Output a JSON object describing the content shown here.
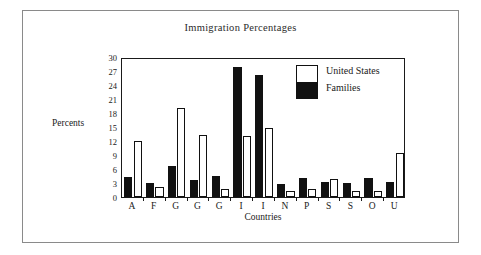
{
  "chart_data": {
    "type": "bar",
    "title": "Immigration Percentages",
    "xlabel": "Countries",
    "ylabel": "Percents",
    "categories": [
      "A",
      "F",
      "G",
      "G",
      "G",
      "I",
      "I",
      "N",
      "P",
      "S",
      "S",
      "O",
      "U"
    ],
    "series": [
      {
        "name": "Families",
        "color": "#111111",
        "values": [
          4.3,
          3.0,
          6.7,
          3.7,
          4.5,
          27.9,
          26.1,
          2.7,
          4.0,
          3.2,
          3.1,
          4.1,
          3.2
        ]
      },
      {
        "name": "United States",
        "color": "#ffffff",
        "values": [
          11.9,
          2.1,
          19.1,
          13.3,
          1.8,
          13.1,
          14.8,
          1.2,
          1.7,
          3.8,
          1.2,
          1.2,
          9.5
        ]
      }
    ],
    "yticks": [
      0,
      3,
      6,
      9,
      12,
      15,
      18,
      21,
      24,
      27,
      30
    ],
    "ylim": [
      0,
      30
    ],
    "grid": false,
    "legend_position": "top-right",
    "legend_entries": [
      "United States",
      "Families"
    ]
  },
  "legend": {
    "items": [
      {
        "label": "United States"
      },
      {
        "label": "Families"
      }
    ]
  }
}
